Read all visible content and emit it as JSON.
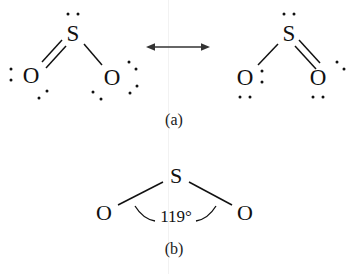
{
  "figure": {
    "background_color": "#ffffff",
    "ink_color": "#111111",
    "panels": [
      {
        "id": "a",
        "caption": "(a)",
        "caption_pos": [
          174,
          120
        ],
        "description": "Two resonance Lewis structures of sulfur dioxide connected by a double-headed resonance arrow",
        "structures": [
          {
            "id": "left-resonance-structure",
            "atoms": [
              {
                "symbol": "S",
                "x": 73,
                "y": 33,
                "name": "sulfur-atom"
              },
              {
                "symbol": "O",
                "x": 31,
                "y": 75,
                "name": "oxygen-atom-left"
              },
              {
                "symbol": "O",
                "x": 112,
                "y": 77,
                "name": "oxygen-atom-right"
              }
            ],
            "bonds": [
              {
                "from": "S",
                "to": "O-left",
                "order": 2,
                "name": "double-bond-s-o-left"
              },
              {
                "from": "S",
                "to": "O-right",
                "order": 1,
                "name": "single-bond-s-o-right"
              }
            ],
            "lone_pairs": [
              {
                "on": "S",
                "dots": [
                  [
                    68,
                    14
                  ],
                  [
                    78,
                    14
                  ]
                ]
              },
              {
                "on": "O-left",
                "dots": [
                  [
                    11,
                    69
                  ],
                  [
                    11,
                    80
                  ]
                ]
              },
              {
                "on": "O-left",
                "dots": [
                  [
                    46,
                    90
                  ],
                  [
                    38,
                    97
                  ]
                ]
              },
              {
                "on": "O-right",
                "dots": [
                  [
                    129,
                    62
                  ],
                  [
                    136,
                    69
                  ]
                ]
              },
              {
                "on": "O-right",
                "dots": [
                  [
                    93,
                    92
                  ],
                  [
                    101,
                    99
                  ]
                ]
              },
              {
                "on": "O-right",
                "dots": [
                  [
                    129,
                    92
                  ],
                  [
                    136,
                    85
                  ]
                ]
              }
            ]
          },
          {
            "id": "right-resonance-structure",
            "atoms": [
              {
                "symbol": "S",
                "x": 289,
                "y": 33,
                "name": "sulfur-atom"
              },
              {
                "symbol": "O",
                "x": 245,
                "y": 77,
                "name": "oxygen-atom-left"
              },
              {
                "symbol": "O",
                "x": 318,
                "y": 77,
                "name": "oxygen-atom-right"
              }
            ],
            "bonds": [
              {
                "from": "S",
                "to": "O-left",
                "order": 1,
                "name": "single-bond-s-o-left"
              },
              {
                "from": "S",
                "to": "O-right",
                "order": 2,
                "name": "double-bond-s-o-right"
              }
            ],
            "lone_pairs": [
              {
                "on": "S",
                "dots": [
                  [
                    284,
                    14
                  ],
                  [
                    294,
                    14
                  ]
                ]
              },
              {
                "on": "O-left",
                "dots": [
                  [
                    262,
                    71
                  ],
                  [
                    262,
                    82
                  ]
                ]
              },
              {
                "on": "O-left",
                "dots": [
                  [
                    240,
                    97
                  ],
                  [
                    250,
                    97
                  ]
                ]
              },
              {
                "on": "O-right",
                "dots": [
                  [
                    336,
                    62
                  ],
                  [
                    343,
                    69
                  ]
                ]
              },
              {
                "on": "O-right",
                "dots": [
                  [
                    313,
                    97
                  ],
                  [
                    323,
                    97
                  ]
                ]
              }
            ]
          }
        ],
        "arrow": {
          "name": "resonance-arrow",
          "x1": 147,
          "y1": 47,
          "x2": 209,
          "y2": 47,
          "double_headed": true
        }
      },
      {
        "id": "b",
        "caption": "(b)",
        "caption_pos": [
          174,
          249
        ],
        "description": "Bent molecular geometry of sulfur dioxide showing the O-S-O bond angle",
        "structure": {
          "id": "geometry-structure",
          "atoms": [
            {
              "symbol": "S",
              "x": 176,
              "y": 176,
              "name": "sulfur-atom"
            },
            {
              "symbol": "O",
              "x": 104,
              "y": 213,
              "name": "oxygen-atom-left"
            },
            {
              "symbol": "O",
              "x": 245,
              "y": 213,
              "name": "oxygen-atom-right"
            }
          ],
          "bonds": [
            {
              "from": "S",
              "to": "O-left",
              "order": 1,
              "name": "bond-s-o-left"
            },
            {
              "from": "S",
              "to": "O-right",
              "order": 1,
              "name": "bond-s-o-right"
            }
          ],
          "angle": {
            "name": "bond-angle-label",
            "value": "119°",
            "x": 176,
            "y": 216
          }
        }
      }
    ]
  }
}
